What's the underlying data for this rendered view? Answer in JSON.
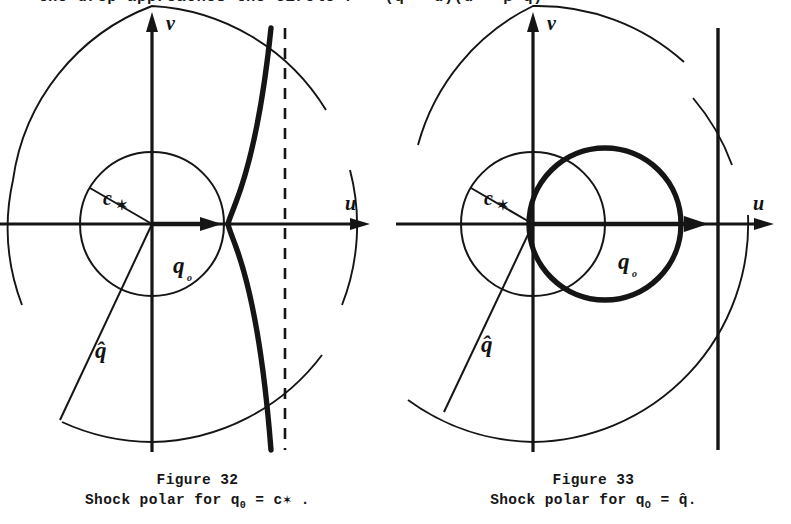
{
  "page": {
    "background_color": "#ffffff",
    "ink_color": "#151515",
    "width": 791,
    "height": 524
  },
  "top_text": {
    "visible_fragment": "the drop approaches the circle r = (q̂ - u)(u - β²q̂)",
    "note": "clipped at the top edge of the screenshot"
  },
  "figures": [
    {
      "id": "figure-32",
      "number": "Figure 32",
      "caption_line1": "Figure 32",
      "caption_line2_prefix": "Shock polar for q",
      "caption_line2_sub": "0",
      "caption_line2_eq": " = c",
      "caption_line2_tail": "✶ .",
      "axis_labels": {
        "x": "u",
        "y": "v"
      },
      "annotations": [
        {
          "name": "c-star",
          "text": "c",
          "sub": "✶"
        },
        {
          "name": "q-zero",
          "text": "q",
          "sub": "o"
        },
        {
          "name": "q-hat",
          "text": "q̂"
        }
      ],
      "elements": [
        "large-circle-radius-q-hat",
        "small-circle-radius-c-star",
        "bold-cusped-shock-polar",
        "dashed-vertical-asymptote",
        "q0-arrow-on-u-axis",
        "c-star-radius-line",
        "q-hat-radius-line"
      ]
    },
    {
      "id": "figure-33",
      "number": "Figure 33",
      "caption_line1": "Figure 33",
      "caption_line2_prefix": "Shock polar for q",
      "caption_line2_sub": "O",
      "caption_line2_eq": " = ",
      "caption_line2_tail": "q̂.",
      "axis_labels": {
        "x": "u",
        "y": "v"
      },
      "annotations": [
        {
          "name": "c-star",
          "text": "c",
          "sub": "✶"
        },
        {
          "name": "q-zero",
          "text": "q",
          "sub": "o"
        },
        {
          "name": "q-hat",
          "text": "q̂"
        }
      ],
      "elements": [
        "large-circle-radius-q-hat",
        "small-circle-radius-c-star",
        "bold-circular-shock-polar",
        "solid-vertical-line",
        "q0-arrow-on-u-axis",
        "c-star-radius-line",
        "q-hat-radius-line"
      ]
    }
  ],
  "geometry": {
    "fig32": {
      "origin": [
        152,
        214
      ],
      "small_circle_r": 72,
      "large_circle_r": 218,
      "cusp_x": 228,
      "dashed_x": 285
    },
    "fig33": {
      "origin": [
        137,
        214
      ],
      "small_circle_r": 72,
      "large_circle_r": 218,
      "polar_circle_center": [
        209,
        214
      ],
      "polar_circle_r": 76,
      "vline_x": 322
    }
  }
}
